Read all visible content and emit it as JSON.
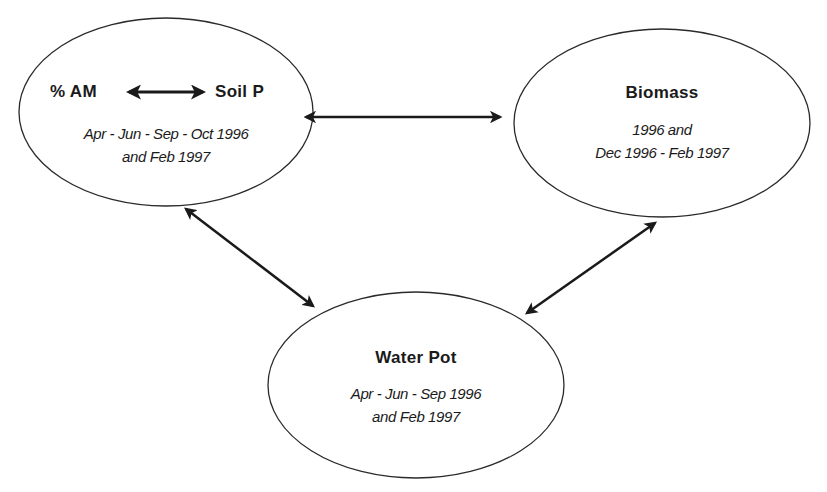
{
  "diagram": {
    "type": "relationship-diagram",
    "nodes": [
      {
        "id": "am_soilp",
        "title_left": "% AM",
        "title_right": "Soil P",
        "subtitle_lines": [
          "Apr - Jun - Sep - Oct 1996",
          "and Feb 1997"
        ]
      },
      {
        "id": "biomass",
        "title": "Biomass",
        "subtitle_lines": [
          "1996 and",
          "Dec 1996 - Feb 1997"
        ]
      },
      {
        "id": "water_pot",
        "title": "Water Pot",
        "subtitle_lines": [
          "Apr - Jun - Sep 1996",
          "and Feb 1997"
        ]
      }
    ],
    "edges": [
      {
        "from": "% AM",
        "to": "Soil P",
        "type": "bidirectional"
      },
      {
        "from": "am_soilp",
        "to": "biomass",
        "type": "bidirectional"
      },
      {
        "from": "am_soilp",
        "to": "water_pot",
        "type": "bidirectional"
      },
      {
        "from": "biomass",
        "to": "water_pot",
        "type": "bidirectional"
      }
    ],
    "colors": {
      "stroke": "#2a2a2a",
      "arrow": "#1a1a1a",
      "background": "#ffffff"
    }
  }
}
